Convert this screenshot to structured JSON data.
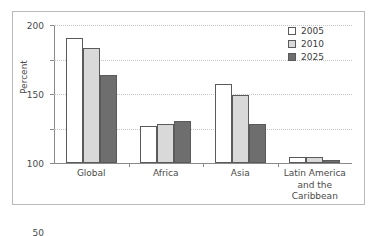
{
  "chart_data": {
    "type": "bar",
    "title": "",
    "subtitle": "",
    "xlabel": "",
    "ylabel": "Percent",
    "ylim": [
      0,
      200
    ],
    "yticks": [
      0,
      50,
      100,
      150,
      200
    ],
    "ytick_labels": [
      "0",
      "50",
      "100",
      "150",
      "200"
    ],
    "grid": true,
    "grid_style": "dotted-horizontal",
    "legend_position": "top-right",
    "categories": [
      "Global",
      "Africa",
      "Asia",
      "Latin America and the Caribbean"
    ],
    "category_label_lines": [
      [
        "Global"
      ],
      [
        "Africa"
      ],
      [
        "Asia"
      ],
      [
        "Latin America",
        "and the",
        "Caribbean"
      ]
    ],
    "series": [
      {
        "name": "2005",
        "color": "#ffffff",
        "values": [
          181,
          53,
          115,
          9
        ]
      },
      {
        "name": "2010",
        "color": "#d9d9d9",
        "values": [
          167,
          56,
          99,
          8
        ]
      },
      {
        "name": "2025",
        "color": "#6e6e6e",
        "values": [
          127,
          61,
          57,
          5
        ]
      }
    ]
  },
  "legend": {
    "items": [
      {
        "label": "2005",
        "swatch_name": "legend-swatch-2005"
      },
      {
        "label": "2010",
        "swatch_name": "legend-swatch-2010"
      },
      {
        "label": "2025",
        "swatch_name": "legend-swatch-2025"
      }
    ]
  },
  "colors": {
    "series_2005": "#ffffff",
    "series_2010": "#d9d9d9",
    "series_2025": "#6e6e6e",
    "bar_outline": "#5a5a5a",
    "axis": "#8a8a8a",
    "gridline": "#c4c4c4",
    "frame": "#b9b9b9",
    "text": "#4a4a4a",
    "background": "#ffffff"
  }
}
